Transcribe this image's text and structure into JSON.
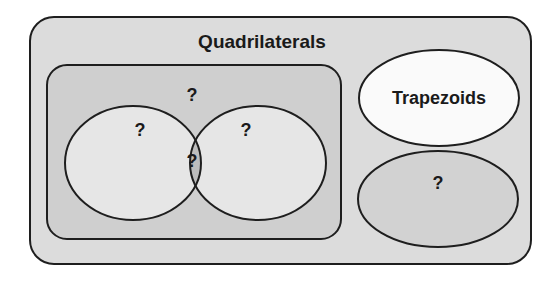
{
  "diagram": {
    "outer": {
      "title": "Quadrilaterals",
      "fill": "#dcdcdc"
    },
    "inner_group": {
      "label": "?",
      "fill": "#cfcfcf"
    },
    "left_set": {
      "label": "?",
      "fill": "#e6e6e6"
    },
    "right_set": {
      "label": "?",
      "fill": "#e6e6e6"
    },
    "intersection": {
      "label": "?",
      "fill": "#bdbdbd"
    },
    "trapezoids": {
      "label": "Trapezoids",
      "fill": "#fafafa"
    },
    "other_set": {
      "label": "?",
      "fill": "#d2d2d2"
    },
    "stroke": "#1e1e1e"
  }
}
